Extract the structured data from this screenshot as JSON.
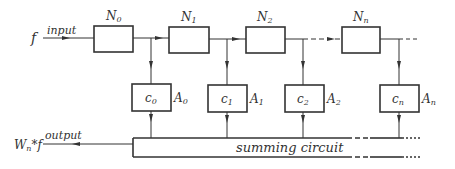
{
  "input": {
    "symbol": "f",
    "label": "input"
  },
  "output": {
    "symbol_main": "W",
    "symbol_sub": "n",
    "symbol_rest": "*f",
    "label": "output"
  },
  "delay_blocks": [
    {
      "name": "N",
      "sub": "0"
    },
    {
      "name": "N",
      "sub": "1"
    },
    {
      "name": "N",
      "sub": "2"
    },
    {
      "name": "N",
      "sub": "n"
    }
  ],
  "coefficient_blocks": [
    {
      "coef": "c",
      "coef_sub": "0",
      "amp": "A",
      "amp_sub": "0"
    },
    {
      "coef": "c",
      "coef_sub": "1",
      "amp": "A",
      "amp_sub": "1"
    },
    {
      "coef": "c",
      "coef_sub": "2",
      "amp": "A",
      "amp_sub": "2"
    },
    {
      "coef": "c",
      "coef_sub": "n",
      "amp": "A",
      "amp_sub": "n"
    }
  ],
  "summing": {
    "label": "summing circuit"
  },
  "colors": {
    "line": "#333333",
    "background": "#ffffff"
  }
}
